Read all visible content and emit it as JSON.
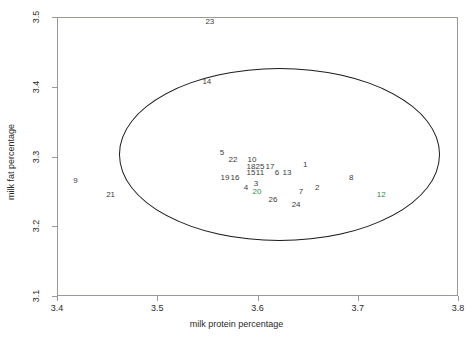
{
  "chart_data": {
    "type": "scatter",
    "title": "",
    "xlabel": "milk protein percentage",
    "ylabel": "milk fat percentage",
    "xlim": [
      3.4,
      3.8
    ],
    "ylim": [
      3.1,
      3.5
    ],
    "xticks": [
      "3.4",
      "3.5",
      "3.6",
      "3.7",
      "3.8"
    ],
    "xtick_values": [
      3.4,
      3.5,
      3.6,
      3.7,
      3.8
    ],
    "yticks": [
      "3.1",
      "3.2",
      "3.3",
      "3.4",
      "3.5"
    ],
    "ytick_values": [
      3.1,
      3.2,
      3.3,
      3.4,
      3.5
    ],
    "grid": false,
    "legend": null,
    "marker_style": "point-index-labels",
    "annotations": [
      {
        "kind": "ellipse",
        "name": "confidence-ellipse",
        "center_x": 3.622,
        "center_y": 3.303,
        "half_width_x": 0.16,
        "half_height_y": 0.1235,
        "color": "#1c1c1c"
      }
    ],
    "colors": {
      "default_point": "#3c3c3c",
      "highlight_point": "#2e8b4f",
      "ellipse": "#1c1c1c",
      "axis": "#9a9a92"
    },
    "points": [
      {
        "label": "23",
        "x": 3.5525,
        "y": 3.4925,
        "color": "#3c3c3c"
      },
      {
        "label": "14",
        "x": 3.5495,
        "y": 3.4065,
        "color": "#3c3c3c"
      },
      {
        "label": "5",
        "x": 3.5645,
        "y": 3.3045,
        "color": "#3c3c3c"
      },
      {
        "label": "22",
        "x": 3.5755,
        "y": 3.2945,
        "color": "#3c3c3c"
      },
      {
        "label": "10",
        "x": 3.5945,
        "y": 3.2945,
        "color": "#3c3c3c"
      },
      {
        "label": "18",
        "x": 3.5935,
        "y": 3.2855,
        "color": "#3c3c3c"
      },
      {
        "label": "25",
        "x": 3.6025,
        "y": 3.2855,
        "color": "#3c3c3c"
      },
      {
        "label": "17",
        "x": 3.6125,
        "y": 3.2855,
        "color": "#3c3c3c"
      },
      {
        "label": "1",
        "x": 3.6475,
        "y": 3.2885,
        "color": "#3c3c3c"
      },
      {
        "label": "15",
        "x": 3.5935,
        "y": 3.2765,
        "color": "#3c3c3c"
      },
      {
        "label": "11",
        "x": 3.6025,
        "y": 3.2765,
        "color": "#3c3c3c"
      },
      {
        "label": "6",
        "x": 3.6195,
        "y": 3.2765,
        "color": "#3c3c3c"
      },
      {
        "label": "13",
        "x": 3.6295,
        "y": 3.2765,
        "color": "#3c3c3c"
      },
      {
        "label": "19",
        "x": 3.5675,
        "y": 3.2695,
        "color": "#3c3c3c"
      },
      {
        "label": "16",
        "x": 3.5775,
        "y": 3.2695,
        "color": "#3c3c3c"
      },
      {
        "label": "8",
        "x": 3.6935,
        "y": 3.2695,
        "color": "#3c3c3c"
      },
      {
        "label": "9",
        "x": 3.4185,
        "y": 3.2645,
        "color": "#3c3c3c"
      },
      {
        "label": "3",
        "x": 3.5985,
        "y": 3.2605,
        "color": "#3c3c3c"
      },
      {
        "label": "4",
        "x": 3.5885,
        "y": 3.2545,
        "color": "#3c3c3c"
      },
      {
        "label": "2",
        "x": 3.6595,
        "y": 3.2555,
        "color": "#3c3c3c"
      },
      {
        "label": "20",
        "x": 3.5995,
        "y": 3.2485,
        "color": "#2e8b4f"
      },
      {
        "label": "7",
        "x": 3.6435,
        "y": 3.2485,
        "color": "#3c3c3c"
      },
      {
        "label": "21",
        "x": 3.4535,
        "y": 3.2445,
        "color": "#3c3c3c"
      },
      {
        "label": "12",
        "x": 3.7235,
        "y": 3.2445,
        "color": "#2e8b4f"
      },
      {
        "label": "26",
        "x": 3.6155,
        "y": 3.2375,
        "color": "#3c3c3c"
      },
      {
        "label": "24",
        "x": 3.6385,
        "y": 3.2305,
        "color": "#3c3c3c"
      }
    ]
  },
  "axes": {
    "x_label": "milk protein percentage",
    "y_label": "milk fat percentage"
  }
}
